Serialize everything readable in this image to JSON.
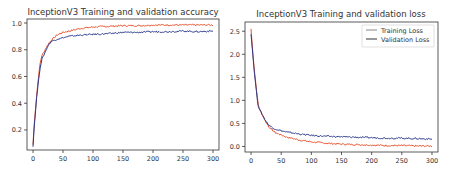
{
  "chart_data": [
    {
      "type": "line",
      "title": "InceptionV3 Training and validation accuracy",
      "xlabel": "",
      "ylabel": "",
      "xlim": [
        -10,
        310
      ],
      "ylim": [
        0.05,
        1.03
      ],
      "xticks": [
        0,
        50,
        100,
        150,
        200,
        250,
        300
      ],
      "yticks": [
        0.2,
        0.4,
        0.6,
        0.8,
        1.0
      ],
      "ytick_labels": [
        "0.2",
        "0.4",
        "0.6",
        "0.8",
        "1.0"
      ],
      "grid": false,
      "legend": null,
      "x": [
        0,
        2,
        4,
        6,
        8,
        10,
        12,
        15,
        18,
        20,
        25,
        30,
        35,
        40,
        50,
        60,
        70,
        80,
        100,
        125,
        150,
        175,
        200,
        225,
        250,
        275,
        300
      ],
      "series": [
        {
          "name": "Training Accuracy",
          "color": "#e8502a",
          "values": [
            0.09,
            0.25,
            0.35,
            0.45,
            0.55,
            0.63,
            0.7,
            0.76,
            0.78,
            0.8,
            0.84,
            0.87,
            0.89,
            0.91,
            0.93,
            0.94,
            0.95,
            0.96,
            0.97,
            0.975,
            0.98,
            0.98,
            0.985,
            0.985,
            0.985,
            0.985,
            0.985
          ]
        },
        {
          "name": "Validation Accuracy",
          "color": "#2b3a8c",
          "values": [
            0.08,
            0.22,
            0.33,
            0.44,
            0.52,
            0.6,
            0.67,
            0.73,
            0.76,
            0.78,
            0.83,
            0.86,
            0.87,
            0.88,
            0.89,
            0.9,
            0.905,
            0.91,
            0.915,
            0.92,
            0.93,
            0.93,
            0.935,
            0.935,
            0.94,
            0.935,
            0.94
          ]
        }
      ]
    },
    {
      "type": "line",
      "title": "InceptionV3 Training and validation loss",
      "xlabel": "",
      "ylabel": "",
      "xlim": [
        -10,
        310
      ],
      "ylim": [
        -0.12,
        2.7
      ],
      "xticks": [
        0,
        50,
        100,
        150,
        200,
        250,
        300
      ],
      "yticks": [
        0.0,
        0.5,
        1.0,
        1.5,
        2.0,
        2.5
      ],
      "ytick_labels": [
        "0.0",
        "0.5",
        "1.0",
        "1.5",
        "2.0",
        "2.5"
      ],
      "grid": false,
      "legend": {
        "position": "upper right",
        "entries": [
          "Training Loss",
          "Validation Loss"
        ]
      },
      "x": [
        0,
        2,
        4,
        6,
        8,
        10,
        12,
        15,
        20,
        25,
        30,
        35,
        40,
        50,
        60,
        70,
        80,
        100,
        125,
        150,
        175,
        200,
        225,
        250,
        275,
        300
      ],
      "series": [
        {
          "name": "Training Loss",
          "color": "#e8502a",
          "values": [
            2.55,
            2.2,
            1.9,
            1.6,
            1.35,
            1.1,
            0.9,
            0.78,
            0.65,
            0.52,
            0.42,
            0.36,
            0.3,
            0.25,
            0.2,
            0.17,
            0.14,
            0.1,
            0.07,
            0.05,
            0.04,
            0.03,
            0.02,
            0.02,
            0.01,
            0.01
          ]
        },
        {
          "name": "Validation Loss",
          "color": "#2b3a8c",
          "values": [
            2.45,
            2.15,
            1.85,
            1.55,
            1.3,
            1.05,
            0.88,
            0.78,
            0.66,
            0.54,
            0.46,
            0.41,
            0.38,
            0.34,
            0.31,
            0.29,
            0.27,
            0.24,
            0.22,
            0.21,
            0.2,
            0.19,
            0.18,
            0.18,
            0.17,
            0.16
          ]
        }
      ]
    }
  ],
  "charts": {
    "accuracy": {
      "title": "InceptionV3 Training and validation accuracy"
    },
    "loss": {
      "title": "InceptionV3 Training and validation loss",
      "legend": {
        "training": "Training Loss",
        "validation": "Validation Loss"
      }
    }
  },
  "colors": {
    "training": "#e8502a",
    "validation": "#2b3a8c",
    "axis": "#333333"
  }
}
